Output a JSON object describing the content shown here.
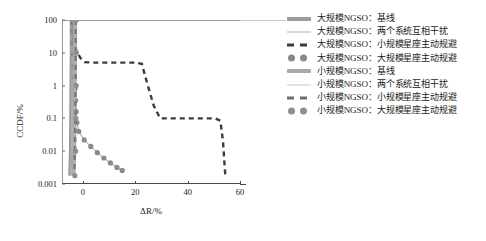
{
  "chart_data": {
    "type": "line",
    "title": "",
    "xlabel": "ΔR/%",
    "ylabel": "CCDF/%",
    "xlim": [
      -8,
      60
    ],
    "ylim": [
      0.001,
      100
    ],
    "yscale": "log",
    "grid": false,
    "legend_position": "right",
    "xticks": [
      "0",
      "20",
      "40",
      "60"
    ],
    "xtick_values": [
      0,
      20,
      40,
      60
    ],
    "yticks": [
      "100",
      "10",
      "1",
      "0.1",
      "0.01",
      "0.001"
    ],
    "ytick_values": [
      100,
      10,
      1,
      0.1,
      0.01,
      0.001
    ],
    "series": [
      {
        "name": "大规模NGSO：基线",
        "style": "thick-solid",
        "color": "#9b9b9b",
        "points": [
          [
            -4.4,
            100
          ],
          [
            -4.4,
            10
          ],
          [
            -4.5,
            1
          ],
          [
            -4.6,
            0.1
          ],
          [
            -4.7,
            0.01
          ],
          [
            -5.0,
            0.0018
          ]
        ]
      },
      {
        "name": "大规模NGSO：两个系统互相干扰",
        "style": "thin-solid",
        "color": "#b4b4b4",
        "points": [
          [
            -4.1,
            100
          ],
          [
            -4.1,
            10
          ],
          [
            -4.2,
            1
          ],
          [
            -4.3,
            0.1
          ],
          [
            -4.4,
            0.01
          ],
          [
            -4.8,
            0.0018
          ]
        ]
      },
      {
        "name": "大规模NGSO：小规模星座主动规避",
        "style": "dashed",
        "color": "#3c3c3c",
        "points": [
          [
            -4.0,
            100
          ],
          [
            -3.6,
            30
          ],
          [
            -2.6,
            12
          ],
          [
            -1.0,
            7
          ],
          [
            0.6,
            5.2
          ],
          [
            4.0,
            5.0
          ],
          [
            12.0,
            5.0
          ],
          [
            20.5,
            5.0
          ],
          [
            22.5,
            4.6
          ],
          [
            24.5,
            1.2
          ],
          [
            27.0,
            0.25
          ],
          [
            29.5,
            0.1
          ],
          [
            36.0,
            0.1
          ],
          [
            44.0,
            0.1
          ],
          [
            50.5,
            0.1
          ],
          [
            52.5,
            0.085
          ],
          [
            53.5,
            0.02
          ],
          [
            54.0,
            0.005
          ],
          [
            54.4,
            0.0018
          ]
        ]
      },
      {
        "name": "大规模NGSO：大规模星座主动规避",
        "style": "dotted-markers",
        "color": "#8a8a8a",
        "points": [
          [
            -4.0,
            100
          ],
          [
            -3.9,
            45
          ],
          [
            -3.8,
            20
          ],
          [
            -3.6,
            9
          ],
          [
            -3.4,
            4
          ],
          [
            -3.2,
            1.8
          ],
          [
            -3.0,
            0.8
          ],
          [
            -2.8,
            0.35
          ],
          [
            -2.6,
            0.16
          ],
          [
            -2.3,
            0.075
          ],
          [
            -1.6,
            0.04
          ],
          [
            0.5,
            0.022
          ],
          [
            3.0,
            0.014
          ],
          [
            5.5,
            0.009
          ],
          [
            8.0,
            0.0062
          ],
          [
            10.5,
            0.0044
          ],
          [
            13.0,
            0.0032
          ],
          [
            15.0,
            0.0026
          ]
        ]
      },
      {
        "name": "小规模NGSO：基线",
        "style": "thick-solid",
        "color": "#a8a8a8",
        "points": [
          [
            -3.2,
            100
          ],
          [
            -3.2,
            10
          ],
          [
            -3.3,
            1
          ],
          [
            -3.4,
            0.1
          ],
          [
            -3.5,
            0.01
          ],
          [
            -3.8,
            0.0018
          ]
        ]
      },
      {
        "name": "小规模NGSO：两个系统互相干扰",
        "style": "thin-solid",
        "color": "#c6c6c6",
        "points": [
          [
            -2.9,
            100
          ],
          [
            -2.9,
            10
          ],
          [
            -3.0,
            1
          ],
          [
            -3.1,
            0.1
          ],
          [
            -3.2,
            0.01
          ],
          [
            -3.5,
            0.0018
          ]
        ]
      },
      {
        "name": "小规模NGSO：小规模星座主动规避",
        "style": "dashed",
        "color": "#6e6e6e",
        "points": [
          [
            -2.7,
            100
          ],
          [
            -2.7,
            10
          ],
          [
            -2.8,
            1
          ],
          [
            -2.9,
            0.1
          ],
          [
            -3.0,
            0.01
          ],
          [
            -3.3,
            0.0018
          ]
        ]
      },
      {
        "name": "小规模NGSO：大规模星座主动规避",
        "style": "dotted-markers",
        "color": "#8f8f8f",
        "points": [
          [
            -2.5,
            100
          ],
          [
            -2.5,
            10
          ],
          [
            -2.6,
            1
          ],
          [
            -2.7,
            0.1
          ],
          [
            -2.8,
            0.01
          ],
          [
            -3.1,
            0.0018
          ]
        ]
      }
    ]
  },
  "legend": {
    "items": [
      {
        "label": "大规模NGSO：基线",
        "key": "thick-solid",
        "color": "#9b9b9b"
      },
      {
        "label": "大规模NGSO：两个系统互相干扰",
        "key": "thin-solid",
        "color": "#b4b4b4"
      },
      {
        "label": "大规模NGSO：小规模星座主动规避",
        "key": "dashed",
        "color": "#3c3c3c"
      },
      {
        "label": "大规模NGSO：大规模星座主动规避",
        "key": "dotted-markers",
        "color": "#8a8a8a"
      },
      {
        "label": "小规模NGSO：基线",
        "key": "thick-solid",
        "color": "#a8a8a8"
      },
      {
        "label": "小规模NGSO：两个系统互相干扰",
        "key": "thin-solid",
        "color": "#c6c6c6"
      },
      {
        "label": "小规模NGSO：小规模星座主动规避",
        "key": "dashed",
        "color": "#6e6e6e"
      },
      {
        "label": "小规模NGSO：大规模星座主动规避",
        "key": "dotted-markers",
        "color": "#8f8f8f"
      }
    ]
  }
}
